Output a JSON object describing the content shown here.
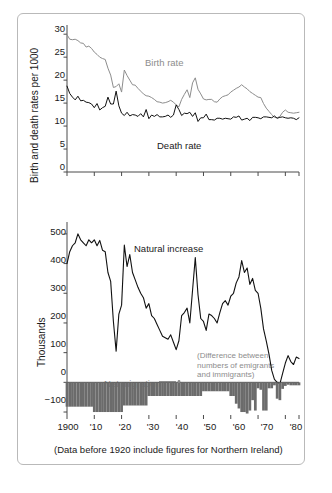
{
  "figure": {
    "caption": "(Data before 1920 include figures for Northern Ireland)",
    "border_color": "#b9b9b9",
    "background": "#ffffff"
  },
  "chart_data": [
    {
      "type": "line",
      "id": "birth-death-rates",
      "title": "",
      "xlabel": "",
      "ylabel": "Birth and death rates per 1000",
      "ylim": [
        0,
        32
      ],
      "xlim": [
        1900,
        1985
      ],
      "yticks": [
        0,
        5,
        10,
        15,
        20,
        25,
        30
      ],
      "ytick_labels": [
        "0",
        "5",
        "10",
        "15",
        "20",
        "25",
        "30"
      ],
      "xticks": [
        1900,
        1910,
        1920,
        1930,
        1940,
        1950,
        1960,
        1970,
        1980
      ],
      "xtick_labels": [
        "",
        "",
        "",
        "",
        "",
        "",
        "",
        "",
        ""
      ],
      "grid": false,
      "legend": "inline-annotations",
      "series": [
        {
          "name": "Birth rate",
          "color": "#8d8d8d",
          "label_x": 1932,
          "label_y": 21.5,
          "x": [
            1900,
            1901,
            1902,
            1903,
            1904,
            1905,
            1906,
            1907,
            1908,
            1909,
            1910,
            1911,
            1912,
            1913,
            1914,
            1915,
            1916,
            1917,
            1918,
            1919,
            1920,
            1921,
            1922,
            1923,
            1924,
            1925,
            1926,
            1927,
            1928,
            1929,
            1930,
            1931,
            1932,
            1933,
            1934,
            1935,
            1936,
            1937,
            1938,
            1939,
            1940,
            1941,
            1942,
            1943,
            1944,
            1945,
            1946,
            1947,
            1948,
            1949,
            1950,
            1951,
            1952,
            1953,
            1954,
            1955,
            1956,
            1957,
            1958,
            1959,
            1960,
            1961,
            1962,
            1963,
            1964,
            1965,
            1966,
            1967,
            1968,
            1969,
            1970,
            1971,
            1972,
            1973,
            1974,
            1975,
            1976,
            1977,
            1978,
            1979,
            1980,
            1981,
            1982,
            1983,
            1984,
            1985
          ],
          "values": [
            29.9,
            28.9,
            28.8,
            28.9,
            28.6,
            28.1,
            28.0,
            27.2,
            27.4,
            26.9,
            26.1,
            25.6,
            25.0,
            24.7,
            24.5,
            22.6,
            21.1,
            18.4,
            18.6,
            19.2,
            17.4,
            22.2,
            21.0,
            20.0,
            19.0,
            18.9,
            18.2,
            17.6,
            17.0,
            16.6,
            16.5,
            16.2,
            15.8,
            15.3,
            15.2,
            15.0,
            15.1,
            15.3,
            15.6,
            15.2,
            14.6,
            14.2,
            15.8,
            16.9,
            17.9,
            16.2,
            19.4,
            20.5,
            18.0,
            17.0,
            15.9,
            15.7,
            15.8,
            15.8,
            15.3,
            15.2,
            15.9,
            16.4,
            16.6,
            16.8,
            17.4,
            17.8,
            18.2,
            18.5,
            19.0,
            18.5,
            18.1,
            17.5,
            17.1,
            16.7,
            16.3,
            16.2,
            14.9,
            13.9,
            13.2,
            12.5,
            11.9,
            11.8,
            12.1,
            13.0,
            13.5,
            13.0,
            12.9,
            12.8,
            12.9,
            13.0
          ]
        },
        {
          "name": "Death rate",
          "color": "#111111",
          "label_x": 1942,
          "label_y": 9.0,
          "x": [
            1900,
            1901,
            1902,
            1903,
            1904,
            1905,
            1906,
            1907,
            1908,
            1909,
            1910,
            1911,
            1912,
            1913,
            1914,
            1915,
            1916,
            1917,
            1918,
            1919,
            1920,
            1921,
            1922,
            1923,
            1924,
            1925,
            1926,
            1927,
            1928,
            1929,
            1930,
            1931,
            1932,
            1933,
            1934,
            1935,
            1936,
            1937,
            1938,
            1939,
            1940,
            1941,
            1942,
            1943,
            1944,
            1945,
            1946,
            1947,
            1948,
            1949,
            1950,
            1951,
            1952,
            1953,
            1954,
            1955,
            1956,
            1957,
            1958,
            1959,
            1960,
            1961,
            1962,
            1963,
            1964,
            1965,
            1966,
            1967,
            1968,
            1969,
            1970,
            1971,
            1972,
            1973,
            1974,
            1975,
            1976,
            1977,
            1978,
            1979,
            1980,
            1981,
            1982,
            1983,
            1984,
            1985
          ],
          "values": [
            18.7,
            17.1,
            16.3,
            15.7,
            16.5,
            15.5,
            15.6,
            15.2,
            15.1,
            14.8,
            14.0,
            14.9,
            13.5,
            14.0,
            14.3,
            16.3,
            14.8,
            14.8,
            17.6,
            14.4,
            12.8,
            12.3,
            13.0,
            12.2,
            12.5,
            12.4,
            12.1,
            12.7,
            12.0,
            13.6,
            11.6,
            12.4,
            12.1,
            12.5,
            12.0,
            12.0,
            12.1,
            12.4,
            11.9,
            12.4,
            14.6,
            13.6,
            12.3,
            12.8,
            12.7,
            13.0,
            12.1,
            12.9,
            11.0,
            11.8,
            11.8,
            12.6,
            11.4,
            11.4,
            11.3,
            11.7,
            11.7,
            11.5,
            11.7,
            11.6,
            11.5,
            12.0,
            11.9,
            12.2,
            11.3,
            11.5,
            11.7,
            11.2,
            11.9,
            11.9,
            11.8,
            11.6,
            12.0,
            12.0,
            11.9,
            11.8,
            12.2,
            11.7,
            11.9,
            12.0,
            11.8,
            11.7,
            11.8,
            11.7,
            11.4,
            11.8
          ]
        }
      ]
    },
    {
      "type": "line-and-bar",
      "id": "natural-increase-net-migration",
      "title": "",
      "xlabel": "",
      "ylabel": "Thousands",
      "ylim": [
        -110,
        540
      ],
      "xlim": [
        1900,
        1985
      ],
      "yticks": [
        -100,
        0,
        100,
        200,
        300,
        400,
        500
      ],
      "ytick_labels": [
        "−100",
        "0",
        "100",
        "200",
        "300",
        "400",
        "500"
      ],
      "xticks": [
        1900,
        1910,
        1920,
        1930,
        1940,
        1950,
        1960,
        1970,
        1980
      ],
      "xtick_labels": [
        "1900",
        "'10",
        "'20",
        "'30",
        "'40",
        "'50",
        "'60",
        "'70",
        "'80"
      ],
      "grid": false,
      "annotations": [
        {
          "name": "natural-increase-label",
          "text": "Natural increase",
          "color": "#111111",
          "x": 1925,
          "y": 452
        },
        {
          "name": "net-migration-label",
          "text": "Net migration",
          "color": "#8d8d8d",
          "x": 1917,
          "y": 32
        },
        {
          "name": "migration-definition-note",
          "text": "(Difference between numbers of emigrants and immigrants)",
          "color": "#8d8d8d",
          "x": 1950,
          "y": 120
        }
      ],
      "series": [
        {
          "name": "Natural increase",
          "type": "line",
          "color": "#111111",
          "x": [
            1900,
            1901,
            1902,
            1903,
            1904,
            1905,
            1906,
            1907,
            1908,
            1909,
            1910,
            1911,
            1912,
            1913,
            1914,
            1915,
            1916,
            1917,
            1918,
            1919,
            1920,
            1921,
            1922,
            1923,
            1924,
            1925,
            1926,
            1927,
            1928,
            1929,
            1930,
            1931,
            1932,
            1933,
            1934,
            1935,
            1936,
            1937,
            1938,
            1939,
            1940,
            1941,
            1942,
            1943,
            1944,
            1945,
            1946,
            1947,
            1948,
            1949,
            1950,
            1951,
            1952,
            1953,
            1954,
            1955,
            1956,
            1957,
            1958,
            1959,
            1960,
            1961,
            1962,
            1963,
            1964,
            1965,
            1966,
            1967,
            1968,
            1969,
            1970,
            1971,
            1972,
            1973,
            1974,
            1975,
            1976,
            1977,
            1978,
            1979,
            1980,
            1981,
            1982,
            1983,
            1984,
            1985
          ],
          "values": [
            400,
            440,
            460,
            470,
            500,
            480,
            470,
            460,
            480,
            470,
            480,
            460,
            478,
            445,
            440,
            370,
            340,
            205,
            105,
            230,
            260,
            462,
            390,
            430,
            370,
            345,
            320,
            300,
            285,
            250,
            265,
            225,
            215,
            195,
            175,
            155,
            150,
            145,
            160,
            135,
            110,
            140,
            225,
            235,
            250,
            200,
            310,
            420,
            295,
            215,
            205,
            175,
            230,
            225,
            215,
            200,
            235,
            265,
            275,
            260,
            290,
            300,
            335,
            355,
            410,
            370,
            385,
            330,
            350,
            310,
            300,
            250,
            180,
            140,
            95,
            40,
            10,
            0,
            -5,
            30,
            65,
            90,
            70,
            60,
            85,
            80
          ]
        },
        {
          "name": "Net migration",
          "type": "bar",
          "color": "#6b6b6b",
          "x": [
            1900,
            1901,
            1902,
            1903,
            1904,
            1905,
            1906,
            1907,
            1908,
            1909,
            1910,
            1911,
            1912,
            1913,
            1914,
            1915,
            1916,
            1917,
            1918,
            1919,
            1920,
            1921,
            1922,
            1923,
            1924,
            1925,
            1926,
            1927,
            1928,
            1929,
            1930,
            1931,
            1932,
            1933,
            1934,
            1935,
            1936,
            1937,
            1938,
            1939,
            1940,
            1941,
            1942,
            1943,
            1944,
            1945,
            1946,
            1947,
            1948,
            1949,
            1950,
            1951,
            1952,
            1953,
            1954,
            1955,
            1956,
            1957,
            1958,
            1959,
            1960,
            1961,
            1962,
            1963,
            1964,
            1965,
            1966,
            1967,
            1968,
            1969,
            1970,
            1971,
            1972,
            1973,
            1974,
            1975,
            1976,
            1977,
            1978,
            1979,
            1980,
            1981,
            1982,
            1983,
            1984,
            1985
          ],
          "values": [
            -82,
            -82,
            -82,
            -82,
            -82,
            -82,
            -82,
            -82,
            -82,
            -82,
            -100,
            -100,
            -100,
            -100,
            -100,
            -100,
            -100,
            -100,
            -100,
            -100,
            -100,
            -78,
            -78,
            -78,
            -78,
            -78,
            -78,
            -78,
            -78,
            -78,
            -46,
            -46,
            -46,
            -46,
            -46,
            -46,
            -46,
            -46,
            -46,
            -46,
            -46,
            -46,
            -46,
            -46,
            -46,
            -46,
            -46,
            -46,
            -46,
            -46,
            -30,
            -30,
            -30,
            -30,
            -30,
            -30,
            -30,
            -30,
            -30,
            -30,
            -46,
            -46,
            -72,
            -88,
            -100,
            -100,
            -105,
            -95,
            -60,
            -95,
            -20,
            -25,
            -95,
            -95,
            -20,
            -20,
            -10,
            -55,
            -60,
            -22,
            -12,
            -8,
            -10,
            -10,
            -10,
            -10
          ]
        }
      ]
    }
  ]
}
